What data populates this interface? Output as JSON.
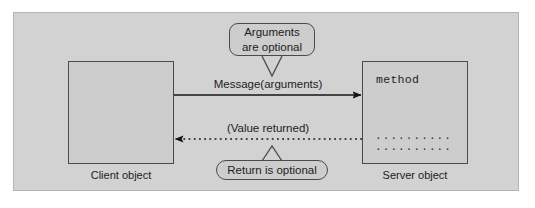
{
  "diagram": {
    "colors": {
      "page_background": "#ffffff",
      "panel_background": "#d2d2d2",
      "panel_border": "#b4b4b4",
      "box_fill": "#cdcdcd",
      "box_border": "#4a4a4a",
      "line": "#141414",
      "text": "#1c1c1c"
    },
    "client": {
      "caption": "Client object"
    },
    "server": {
      "caption": "Server object",
      "method_label": "method",
      "code_line_1": "..........",
      "code_line_2": ".........."
    },
    "arrows": {
      "message": {
        "label": "Message(arguments)",
        "style": "solid",
        "direction": "right"
      },
      "return": {
        "label": "(Value returned)",
        "style": "dotted",
        "direction": "left"
      }
    },
    "callouts": {
      "arguments": {
        "line1": "Arguments",
        "line2": "are optional",
        "tail": "down"
      },
      "return": {
        "line1": "Return is optional",
        "tail": "up"
      }
    }
  }
}
